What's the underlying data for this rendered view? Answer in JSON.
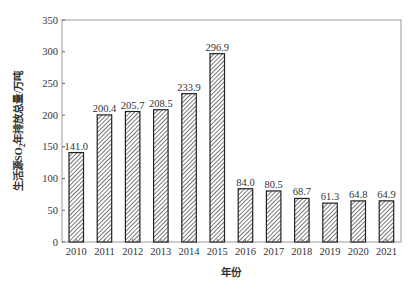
{
  "chart_data": {
    "type": "bar",
    "title": "",
    "xlabel": "年份",
    "ylabel": "生活源SO₂年排放总量/万吨",
    "ylabel_parts": {
      "pre": "生活源SO",
      "sub": "2",
      "post": "年排放总量/万吨"
    },
    "categories": [
      "2010",
      "2011",
      "2012",
      "2013",
      "2014",
      "2015",
      "2016",
      "2017",
      "2018",
      "2019",
      "2020",
      "2021"
    ],
    "values": [
      141.0,
      200.4,
      205.7,
      208.5,
      233.9,
      296.9,
      84.0,
      80.5,
      68.7,
      61.3,
      64.8,
      64.9
    ],
    "value_labels": [
      "141.0",
      "200.4",
      "205.7",
      "208.5",
      "233.9",
      "296.9",
      "84.0",
      "80.5",
      "68.7",
      "61.3",
      "64.8",
      "64.9"
    ],
    "ylim": [
      0,
      350
    ],
    "yticks": [
      0,
      50,
      100,
      150,
      200,
      250,
      300,
      350
    ],
    "grid": false,
    "legend": null,
    "bar_fill": "hatched diagonal",
    "colors": {
      "bar_stroke": "#222222",
      "hatch": "#555555",
      "axis": "#999999"
    }
  }
}
